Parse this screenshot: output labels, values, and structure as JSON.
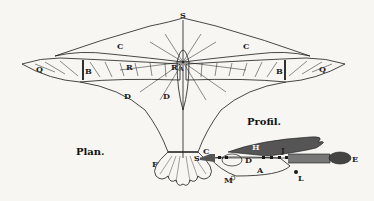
{
  "figure": {
    "plan_caption": "Plan.",
    "profile_caption": "Profil.",
    "ink_color": "#1a1a1a",
    "paper_color": "#f7f6f3",
    "shade_color": "#555555"
  },
  "plan_labels": {
    "S": "S",
    "C_left": "C",
    "C_right": "C",
    "Q_left": "Q",
    "Q_right": "Q",
    "B_left": "B",
    "B_right": "B",
    "R_left": "R",
    "R_right": "R",
    "D_left": "D",
    "D_right": "D",
    "F": "F",
    "center": "A"
  },
  "profile_labels": {
    "S": "S",
    "C": "C",
    "H": "H",
    "J": "J",
    "D": "D",
    "A": "A",
    "M": "M",
    "L": "L",
    "E": "E"
  }
}
